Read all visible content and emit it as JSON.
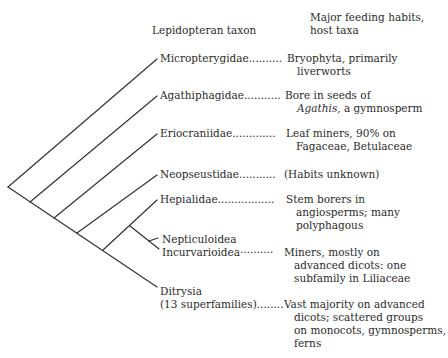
{
  "headers": {
    "taxon": "Lepidopteran taxon",
    "habits_line1": "Major feeding habits,",
    "habits_line2": "host taxa"
  },
  "rows": [
    {
      "taxon": "Micropterygidae",
      "dots": "..........",
      "habit_lines": [
        "Bryophyta, primarily",
        "liverworts"
      ]
    },
    {
      "taxon": "Agathiphagidae",
      "dots": "...........",
      "habit_first": "Bore in seeds of",
      "habit_italic": "Agathis",
      "habit_rest": ", a gymnosperm"
    },
    {
      "taxon": "Eriocraniidae",
      "dots": ".............",
      "habit_lines": [
        "Leaf miners, 90% on",
        "Fagaceae, Betulaceae"
      ]
    },
    {
      "taxon": "Neopseustidae",
      "dots": "...........",
      "habit_lines": [
        "(Habits unknown)"
      ]
    },
    {
      "taxon": "Hepialidae",
      "dots": ".................",
      "habit_lines": [
        "Stem borers in",
        "angiosperms; many",
        "polyphagous"
      ]
    },
    {
      "taxon_lines": [
        "Nepticuloidea",
        "Incurvarioidea"
      ],
      "dots": "..........",
      "habit_lines": [
        "Miners, mostly on",
        "advanced dicots: one",
        "subfamily in Liliaceae"
      ]
    },
    {
      "taxon_lines": [
        "Ditrysia",
        "(13 superfamilies)"
      ],
      "dots": "........",
      "habit_lines": [
        "Vast majority on advanced",
        "dicots; scattered groups",
        "on monocots, gymnosperms,",
        "ferns"
      ]
    }
  ]
}
